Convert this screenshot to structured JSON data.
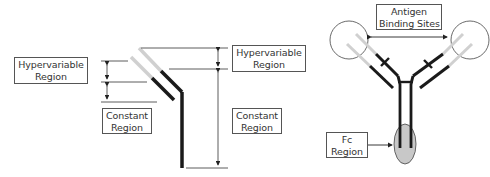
{
  "diagram": {
    "left_panel": {
      "labels": {
        "hypervariable_left": [
          "Hypervariable",
          "Region"
        ],
        "constant_left": [
          "Constant",
          "Region"
        ],
        "hypervariable_right": [
          "Hypervariable",
          "Region"
        ],
        "constant_right": [
          "Constant",
          "Region"
        ]
      }
    },
    "right_panel": {
      "labels": {
        "antigen_binding": [
          "Antigen",
          "Binding Sites"
        ],
        "fc_region": [
          "Fc",
          "Region"
        ]
      }
    },
    "colors": {
      "heavy_chain": "#1a1a1a",
      "hypervariable": "#d0d0d0",
      "fc_fill": "#c8c8c8",
      "line": "#333333"
    }
  }
}
